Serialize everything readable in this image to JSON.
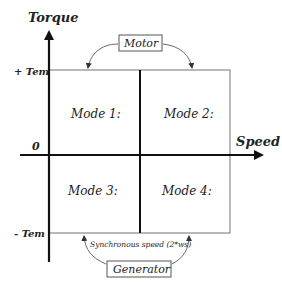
{
  "diagram": {
    "axes": {
      "y_label": "Torque",
      "x_label": "Speed",
      "origin_label": "0",
      "y_ticks": [
        "+ Tem",
        "- Tem"
      ]
    },
    "quadrants": [
      {
        "label": "Mode 1:"
      },
      {
        "label": "Mode 2:"
      },
      {
        "label": "Mode 3:"
      },
      {
        "label": "Mode 4:"
      }
    ],
    "annotations": {
      "top_box": "Motor",
      "bottom_box": "Generator",
      "bottom_note": "Synchronous speed (2*ws)"
    },
    "colors": {
      "axis": "#111111",
      "box_border": "#8a8a8a",
      "text": "#222222",
      "background": "#ffffff"
    }
  }
}
